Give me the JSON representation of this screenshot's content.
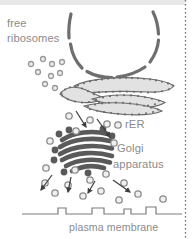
{
  "diagram": {
    "background_color": "#ffffff",
    "top_band_color": "#e8e8e8",
    "labels": {
      "free_ribosomes_line1": "free",
      "free_ribosomes_line2": "ribosomes",
      "rer": "rER",
      "golgi_line1": "Golgi",
      "golgi_line2": "apparatus",
      "plasma_membrane": "plasma membrane"
    },
    "colors": {
      "text": "#8b8b8b",
      "nuclear_envelope": "#6e6e6e",
      "rer_outline": "#6b6b6b",
      "rer_fill": "#e2e2e2",
      "golgi": "#5a5a5a",
      "vesicle_outline": "#8a8a8a",
      "vesicle_fill": "#f0f0f0",
      "ribosome_dot": "#9a9a9a",
      "membrane_line": "#7c7c7c",
      "arrow": "#4a4a4a",
      "border_dotted": "#6b6b6b"
    },
    "structures": [
      {
        "name": "nuclear-envelope",
        "description": "segmented U-shaped arc with nuclear pore gaps at top of cell"
      },
      {
        "name": "free-ribosomes",
        "description": "scattered small ring dots in cytosol at upper left",
        "count": 9
      },
      {
        "name": "rough-endoplasmic-reticulum",
        "description": "stacked wavy cisternae studded with ribosomes",
        "cisternae": 4
      },
      {
        "name": "golgi-apparatus",
        "description": "dark stack of curved flattened sacs",
        "cisternae": 6
      },
      {
        "name": "transport-vesicles",
        "description": "circles budding from rER and Golgi toward plasma membrane",
        "count": 20
      },
      {
        "name": "plasma-membrane",
        "description": "horizontal line with four raised channel bumps",
        "bumps": 4
      },
      {
        "name": "transport-arrows",
        "description": "arrows showing direction of vesicle movement",
        "count": 6
      }
    ],
    "right_border": "vertical dotted divider line"
  }
}
